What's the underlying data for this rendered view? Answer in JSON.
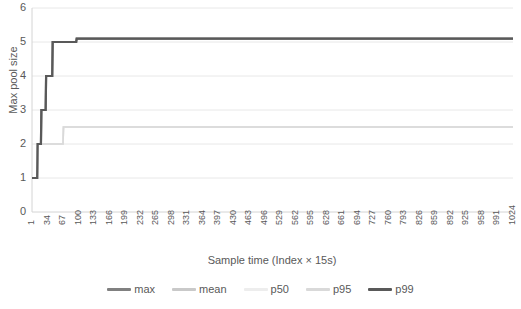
{
  "chart_data": {
    "type": "line",
    "title": "",
    "xlabel": "Sample time (Index × 15s)",
    "ylabel": "Max pool size",
    "xlim": [
      1,
      1024
    ],
    "ylim": [
      0,
      6
    ],
    "ytick_labels": [
      "0",
      "1",
      "2",
      "3",
      "4",
      "5",
      "6"
    ],
    "ytick_values": [
      0,
      1,
      2,
      3,
      4,
      5,
      6
    ],
    "grid": "horizontal",
    "legend_position": "bottom",
    "xtick_labels": [
      "1",
      "34",
      "67",
      "100",
      "133",
      "166",
      "199",
      "232",
      "265",
      "298",
      "331",
      "364",
      "397",
      "430",
      "463",
      "496",
      "529",
      "562",
      "595",
      "628",
      "661",
      "694",
      "727",
      "760",
      "793",
      "826",
      "859",
      "892",
      "925",
      "958",
      "991",
      "1024"
    ],
    "xtick_values": [
      1,
      34,
      67,
      100,
      133,
      166,
      199,
      232,
      265,
      298,
      331,
      364,
      397,
      430,
      463,
      496,
      529,
      562,
      595,
      628,
      661,
      694,
      727,
      760,
      793,
      826,
      859,
      892,
      925,
      958,
      991,
      1024
    ],
    "series": [
      {
        "name": "max",
        "color": "#808080",
        "x": [
          1,
          12,
          13,
          20,
          21,
          30,
          31,
          44,
          45,
          95,
          96,
          1024
        ],
        "values": [
          1,
          1,
          2,
          2,
          3,
          3,
          4,
          4,
          5,
          5,
          5.1,
          5.1
        ]
      },
      {
        "name": "mean",
        "color": "#c9c9c9",
        "x": [
          1,
          12,
          13,
          67,
          68,
          1024
        ],
        "values": [
          1,
          1,
          2,
          2,
          2.5,
          2.5
        ]
      },
      {
        "name": "p50",
        "color": "#ededed",
        "x": [
          1,
          12,
          13,
          67,
          68,
          1024
        ],
        "values": [
          1,
          1,
          2,
          2,
          2.5,
          2.5
        ]
      },
      {
        "name": "p95",
        "color": "#d9d9d9",
        "x": [
          1,
          12,
          13,
          67,
          68,
          1024
        ],
        "values": [
          1,
          1,
          2,
          2,
          2.5,
          2.5
        ]
      },
      {
        "name": "p99",
        "color": "#595959",
        "x": [
          1,
          12,
          13,
          20,
          21,
          30,
          31,
          44,
          45,
          95,
          96,
          1024
        ],
        "values": [
          1,
          1,
          2,
          2,
          3,
          3,
          4,
          4,
          5,
          5,
          5.1,
          5.1
        ]
      }
    ]
  },
  "legend": {
    "items": [
      {
        "label": "max",
        "color": "#808080"
      },
      {
        "label": "mean",
        "color": "#c9c9c9"
      },
      {
        "label": "p50",
        "color": "#ededed"
      },
      {
        "label": "p95",
        "color": "#d9d9d9"
      },
      {
        "label": "p99",
        "color": "#595959"
      }
    ]
  },
  "colors": {
    "gridline": "#e8e8e8",
    "axis": "#d4d4d4",
    "text": "#595959",
    "background": "#ffffff"
  }
}
